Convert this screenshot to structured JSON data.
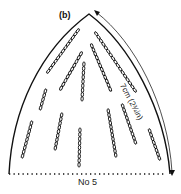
{
  "diagram": {
    "panel_label": "(b)",
    "dimension_label": "7cm (2¾in)",
    "baseline_label": "No 5",
    "stroke_color": "#111111",
    "background_color": "#ffffff",
    "chain_lines": [
      {
        "x1": 47,
        "y1": 73,
        "x2": 79,
        "y2": 29
      },
      {
        "x1": 60,
        "y1": 90,
        "x2": 82,
        "y2": 52
      },
      {
        "x1": 82,
        "y1": 101,
        "x2": 84,
        "y2": 62
      },
      {
        "x1": 95,
        "y1": 32,
        "x2": 136,
        "y2": 92
      },
      {
        "x1": 91,
        "y1": 44,
        "x2": 111,
        "y2": 91
      },
      {
        "x1": 40,
        "y1": 110,
        "x2": 46,
        "y2": 89
      },
      {
        "x1": 22,
        "y1": 158,
        "x2": 32,
        "y2": 121
      },
      {
        "x1": 55,
        "y1": 150,
        "x2": 62,
        "y2": 113
      },
      {
        "x1": 79,
        "y1": 167,
        "x2": 80,
        "y2": 128
      },
      {
        "x1": 108,
        "y1": 109,
        "x2": 116,
        "y2": 157
      },
      {
        "x1": 122,
        "y1": 104,
        "x2": 136,
        "y2": 144
      },
      {
        "x1": 149,
        "y1": 129,
        "x2": 160,
        "y2": 160
      }
    ]
  }
}
